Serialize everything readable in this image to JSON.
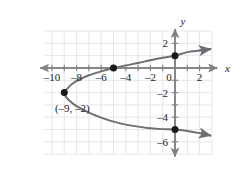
{
  "chart_data": {
    "type": "line",
    "title": "",
    "xlabel": "x",
    "ylabel": "y",
    "xlim": [
      -11,
      3.6
    ],
    "ylim": [
      -7.4,
      3.2
    ],
    "grid": true,
    "grid_spacing": 1,
    "tick_spacing": 1,
    "legend": "none",
    "curve_description": "Rightward-opening sideways parabola with vertex at (-9, -2)",
    "x_tick_labels": [
      {
        "value": -10,
        "text": "–10"
      },
      {
        "value": -8,
        "text": "–8"
      },
      {
        "value": -6,
        "text": "–6"
      },
      {
        "value": -4,
        "text": "–4"
      },
      {
        "value": -2,
        "text": "–2"
      },
      {
        "value": 0,
        "text": "0"
      },
      {
        "value": 2,
        "text": "2"
      }
    ],
    "y_tick_labels": [
      {
        "value": 2,
        "text": "2"
      },
      {
        "value": -2,
        "text": "–2"
      },
      {
        "value": -4,
        "text": "–4"
      },
      {
        "value": -6,
        "text": "–6"
      }
    ],
    "points": [
      {
        "x": -9,
        "y": -2,
        "label": "(–9, –2)",
        "label_x": -8.35,
        "label_y": -3.55
      },
      {
        "x": -5,
        "y": 0,
        "label": ""
      },
      {
        "x": 0,
        "y": 1,
        "label": ""
      },
      {
        "x": 0,
        "y": -5,
        "label": ""
      }
    ],
    "curve_points": [
      {
        "x": 2.9,
        "y": 1.54
      },
      {
        "x": 2.0,
        "y": 1.42
      },
      {
        "x": 1.0,
        "y": 1.29
      },
      {
        "x": 0.0,
        "y": 1.0
      },
      {
        "x": -1.0,
        "y": 0.83
      },
      {
        "x": -2.0,
        "y": 0.63
      },
      {
        "x": -3.0,
        "y": 0.41
      },
      {
        "x": -4.0,
        "y": 0.21
      },
      {
        "x": -5.0,
        "y": 0.0
      },
      {
        "x": -6.0,
        "y": -0.27
      },
      {
        "x": -7.0,
        "y": -0.59
      },
      {
        "x": -7.8,
        "y": -0.95
      },
      {
        "x": -8.4,
        "y": -1.32
      },
      {
        "x": -8.8,
        "y": -1.72
      },
      {
        "x": -9.0,
        "y": -2.0
      },
      {
        "x": -8.88,
        "y": -2.33
      },
      {
        "x": -8.5,
        "y": -2.73
      },
      {
        "x": -8.0,
        "y": -3.1
      },
      {
        "x": -7.0,
        "y": -3.62
      },
      {
        "x": -6.0,
        "y": -4.03
      },
      {
        "x": -5.0,
        "y": -4.36
      },
      {
        "x": -4.0,
        "y": -4.6
      },
      {
        "x": -3.0,
        "y": -4.77
      },
      {
        "x": -2.0,
        "y": -4.9
      },
      {
        "x": -1.0,
        "y": -4.97
      },
      {
        "x": 0.0,
        "y": -5.0
      },
      {
        "x": 1.0,
        "y": -5.12
      },
      {
        "x": 2.0,
        "y": -5.3
      },
      {
        "x": 2.9,
        "y": -5.5
      }
    ],
    "colors": {
      "curve": "#6e6e73",
      "axis": "#808085",
      "grid": "#e0e0e6",
      "point": "#1a1a1a",
      "text": "#1a1a1a"
    }
  }
}
